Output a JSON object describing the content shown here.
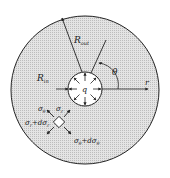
{
  "diagram": {
    "labels": {
      "outer_radius": "R",
      "outer_radius_sub": "out",
      "inner_radius": "R",
      "inner_radius_sub": "in",
      "angle": "θ",
      "radial_axis": "r",
      "pressure": "q",
      "sigma_theta": "σ",
      "sigma_theta_sub": "θ",
      "sigma_r": "σ",
      "sigma_r_sub": "r",
      "sigma_r_plus": "σ",
      "sigma_r_plus_sub": "r",
      "sigma_r_plus_tail": "+dσ",
      "sigma_r_plus_tail_sub": "r",
      "sigma_theta_plus": "σ",
      "sigma_theta_plus_sub": "θ",
      "sigma_theta_plus_tail": "+dσ",
      "sigma_theta_plus_tail_sub": "θ"
    },
    "colors": {
      "fill": "#d9d9d9",
      "stroke": "#222222",
      "inner_fill": "#ffffff",
      "background": "#ffffff"
    }
  }
}
